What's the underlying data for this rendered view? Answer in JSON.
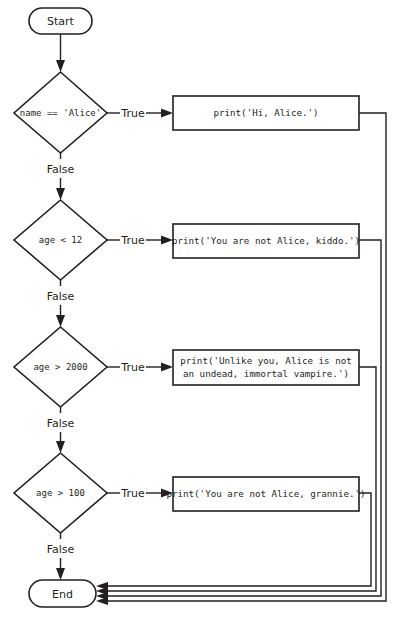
{
  "diagram": {
    "type": "flowchart",
    "start": {
      "label": "Start"
    },
    "end": {
      "label": "End"
    },
    "branch_labels": {
      "true": "True",
      "false": "False"
    },
    "decisions": [
      {
        "condition": "name == 'Alice'",
        "action_lines": [
          "print('Hi, Alice.')"
        ]
      },
      {
        "condition": "age < 12",
        "action_lines": [
          "print('You are not Alice, kiddo.')"
        ]
      },
      {
        "condition": "age > 2000",
        "action_lines": [
          "print('Unlike you, Alice is not",
          "an undead, immortal vampire.')"
        ]
      },
      {
        "condition": "age > 100",
        "action_lines": [
          "print('You are not Alice, grannie.')"
        ]
      }
    ],
    "colors": {
      "stroke": "#231f20",
      "fill": "#ffffff",
      "background": "#ffffff"
    }
  }
}
